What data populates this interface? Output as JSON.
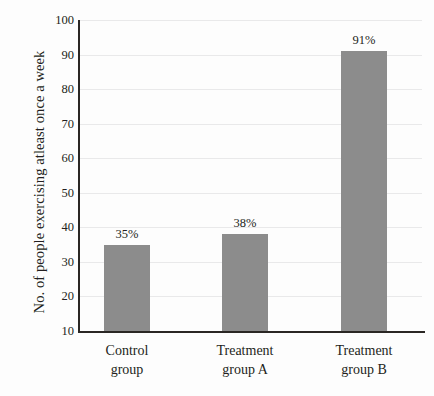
{
  "chart_data": {
    "type": "bar",
    "title": "",
    "subtitle": "",
    "xlabel": "",
    "ylabel": "No. of people exercising atleast once a week",
    "categories": [
      "Control group",
      "Treatment group A",
      "Treatment group B"
    ],
    "category_lines": [
      [
        "Control",
        "group"
      ],
      [
        "Treatment",
        "group A"
      ],
      [
        "Treatment",
        "group B"
      ]
    ],
    "values": [
      35,
      38,
      91
    ],
    "data_labels": [
      "35%",
      "38%",
      "91%"
    ],
    "ylim": [
      10,
      100
    ],
    "yticks": [
      10,
      20,
      30,
      40,
      50,
      60,
      70,
      80,
      90,
      100
    ],
    "ytick_labels": [
      "10",
      "20",
      "30",
      "40",
      "50",
      "60",
      "70",
      "80",
      "90",
      "100"
    ],
    "grid": true,
    "grid_axis": "y",
    "legend": false,
    "legend_position": "none",
    "bar_color": "#8c8c8c",
    "axis_color": "#2a2724",
    "grid_color": "#e9e9ea",
    "background_color": "#fdfdfd",
    "text_color": "#231f20"
  }
}
